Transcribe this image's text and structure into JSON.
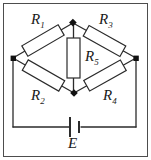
{
  "figure": {
    "kind": "circuit-schematic",
    "border_color": "#4d4d4d",
    "wire_color": "#2b2b2b",
    "node_color": "#111111",
    "background": "#ffffff"
  },
  "components": {
    "r1": {
      "label": "R",
      "sub": "1"
    },
    "r2": {
      "label": "R",
      "sub": "2"
    },
    "r3": {
      "label": "R",
      "sub": "3"
    },
    "r4": {
      "label": "R",
      "sub": "4"
    },
    "r5": {
      "label": "R",
      "sub": "5"
    },
    "battery": {
      "label": "E"
    }
  }
}
